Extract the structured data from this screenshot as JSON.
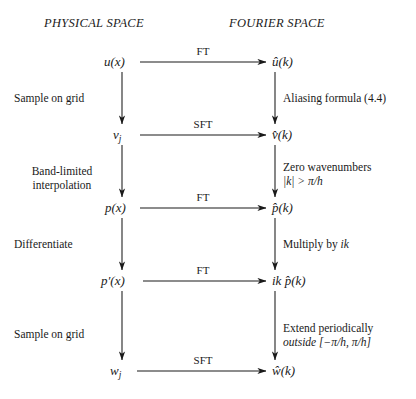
{
  "diagram": {
    "title_physical": "PHYSICAL SPACE",
    "title_fourier": "FOURIER SPACE",
    "nodes": {
      "u_x": "u(x)",
      "u_hat": "û(k)",
      "v_j": "v",
      "v_j_sub": "j",
      "v_hat": "v̂(k)",
      "p_x": "p(x)",
      "p_hat": "p̂(k)",
      "dp_x": "p′(x)",
      "ik_p_hat": "ik p̂(k)",
      "ik_prefix": "ik",
      "w_j": "w",
      "w_j_sub": "j",
      "w_hat": "ŵ(k)"
    },
    "horizontal_arrows": [
      {
        "label": "FT"
      },
      {
        "label": "SFT"
      },
      {
        "label": "FT"
      },
      {
        "label": "FT"
      },
      {
        "label": "SFT"
      }
    ],
    "left_labels": [
      {
        "line1": "Sample on grid",
        "line2": ""
      },
      {
        "line1": "Band-limited",
        "line2": "interpolation"
      },
      {
        "line1": "Differentiate",
        "line2": ""
      },
      {
        "line1": "Sample on grid",
        "line2": ""
      }
    ],
    "right_labels": [
      {
        "line1": "Aliasing formula (4.4)",
        "line2": ""
      },
      {
        "line1": "Zero wavenumbers",
        "line2": "|k| > π/h"
      },
      {
        "line1": "Multiply by ",
        "line2": "",
        "math": "ik"
      },
      {
        "line1": "Extend periodically",
        "line2": "outside [−π/h, π/h]"
      }
    ],
    "colors": {
      "ink": "#1a1a1a",
      "background": "#ffffff"
    }
  }
}
